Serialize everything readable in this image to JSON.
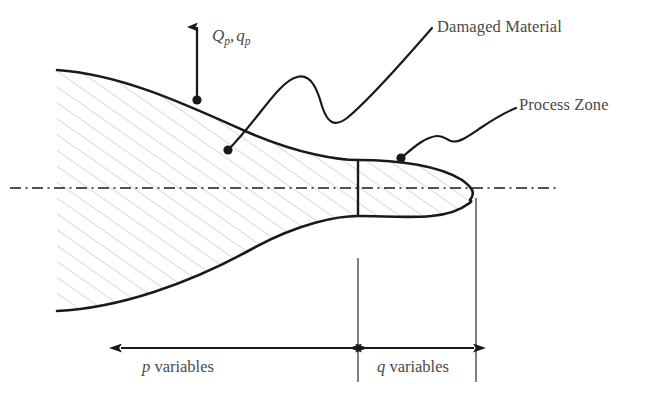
{
  "figure": {
    "background_color": "#ffffff",
    "line_color": "#1a1a1a",
    "hatch_color": "#b9b9b9",
    "text_color": "#4a4a4a"
  },
  "labels": {
    "load_symbol": {
      "base_main": "Q",
      "base_sub": "p",
      "separator": ",",
      "second_main": "q",
      "second_sub": "p",
      "full_text": "Qp, qp"
    },
    "damaged_material": "Damaged Material",
    "process_zone": "Process Zone",
    "p_variables": {
      "symbol": "p",
      "word": "variables",
      "full_text": "p variables"
    },
    "q_variables": {
      "symbol": "q",
      "word": "variables",
      "full_text": "q variables"
    }
  },
  "annotations": {
    "load_arrow": {
      "name": "vertical-load-arrow",
      "tip_x": 197,
      "tip_y": 16,
      "base_x": 197,
      "base_y": 100
    },
    "damaged_material_leader": {
      "dot_x": 228,
      "dot_y": 150,
      "end_x": 432,
      "end_y": 28
    },
    "process_zone_leader": {
      "dot_x": 401,
      "dot_y": 158,
      "end_x": 516,
      "end_y": 108
    }
  },
  "dimension_lines": {
    "centerline_y": 188,
    "centerline_x_start": 10,
    "centerline_x_end": 556,
    "divider_x": 358,
    "right_edge_x": 476,
    "dim_y": 348,
    "p_left_x": 120,
    "p_right_x": 356,
    "q_left_x": 360,
    "q_right_x": 474
  },
  "regions": {
    "damaged_material_region": "hatched-body",
    "process_zone_region": "hatched-tip"
  }
}
